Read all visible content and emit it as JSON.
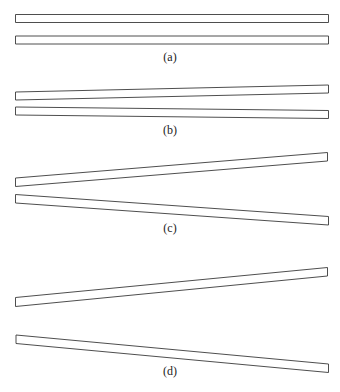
{
  "figure": {
    "panels": [
      {
        "id": "a",
        "label": "(a)",
        "description": "two parallel horizontal bars",
        "top_bar_tilt": "none",
        "bottom_bar_tilt": "none"
      },
      {
        "id": "b",
        "label": "(b)",
        "description": "bars diverging slightly toward the right",
        "top_bar_tilt": "slight-up",
        "bottom_bar_tilt": "slight-down"
      },
      {
        "id": "c",
        "label": "(c)",
        "description": "bars diverging moderately toward the right",
        "top_bar_tilt": "up",
        "bottom_bar_tilt": "down"
      },
      {
        "id": "d",
        "label": "(d)",
        "description": "bars diverging strongly toward the right with a gap at the left",
        "top_bar_tilt": "up",
        "bottom_bar_tilt": "down"
      }
    ],
    "colors": {
      "stroke": "#3a3a3a",
      "fill": "#ffffff",
      "background": "#ffffff"
    }
  }
}
